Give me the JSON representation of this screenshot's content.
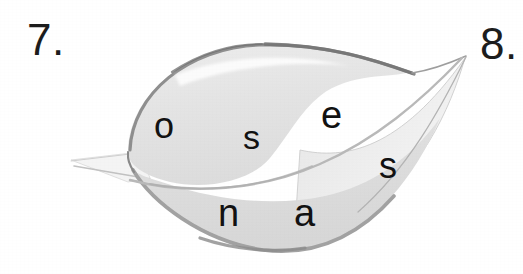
{
  "page": {
    "background_color": "#ffffff",
    "width": 523,
    "height": 274
  },
  "exercises": {
    "left_number": "7.",
    "right_number": "8."
  },
  "figure": {
    "name": "leaf-illustration",
    "fill_color": "#e4e4e4",
    "outline_color": "#9a9a9a",
    "outline_dark_color": "#7e7e7e",
    "vein_color": "#bdbdbd",
    "stem_color": "#f2f2f2"
  },
  "scramble": {
    "word_letters": [
      "o",
      "s",
      "e",
      "s",
      "n",
      "a"
    ],
    "letters": [
      {
        "char": "o",
        "x": 154,
        "y": 108,
        "size": 36
      },
      {
        "char": "s",
        "x": 243,
        "y": 120,
        "size": 34
      },
      {
        "char": "e",
        "x": 321,
        "y": 96,
        "size": 38
      },
      {
        "char": "s",
        "x": 379,
        "y": 148,
        "size": 36
      },
      {
        "char": "n",
        "x": 218,
        "y": 194,
        "size": 38
      },
      {
        "char": "a",
        "x": 294,
        "y": 194,
        "size": 38
      }
    ]
  }
}
